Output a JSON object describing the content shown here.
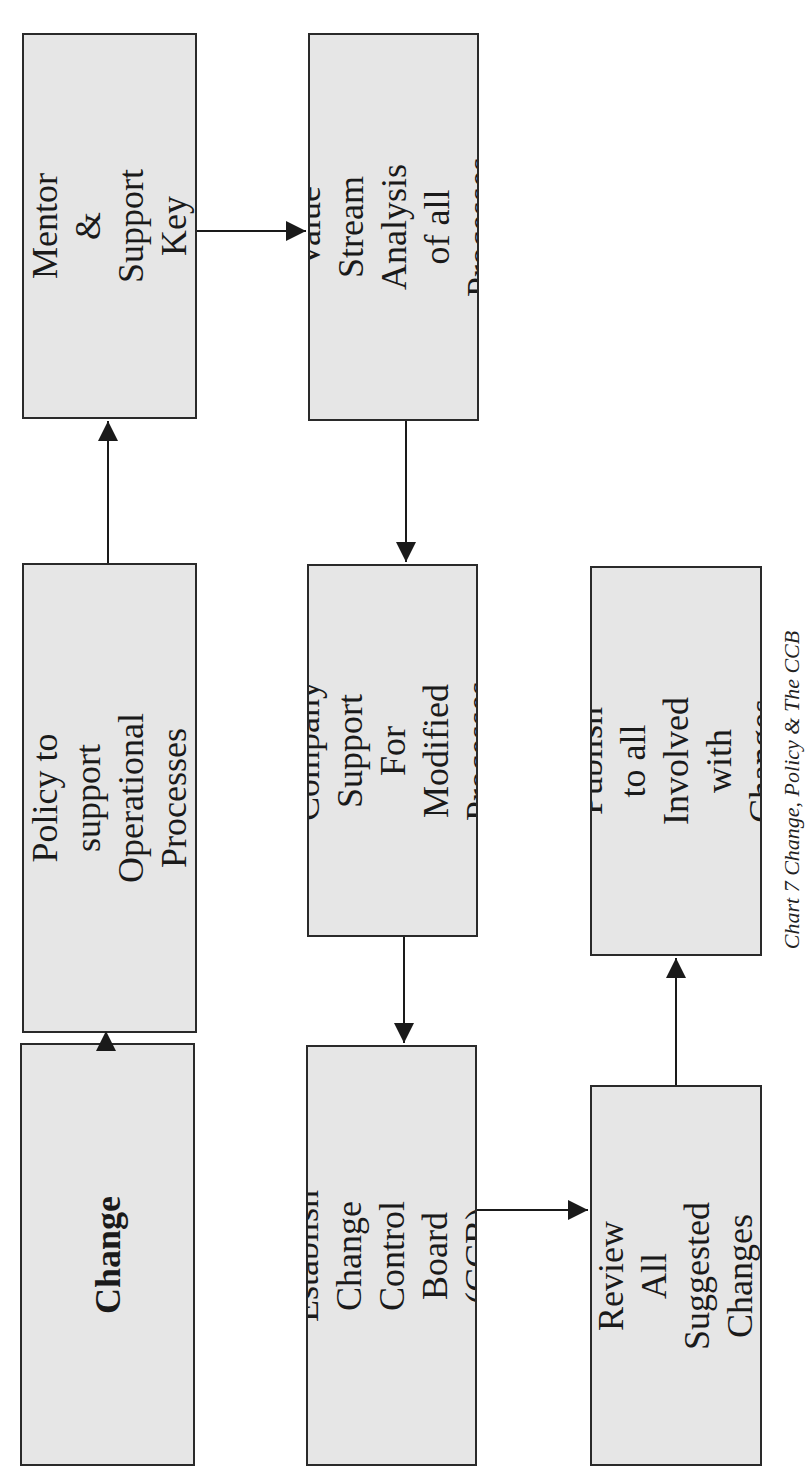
{
  "diagram": {
    "caption": "Chart 7  Change, Policy & The CCB",
    "orientation": "rotated 90° counterclockwise",
    "nodes": [
      {
        "id": "change",
        "label": "Change",
        "bold": true
      },
      {
        "id": "policy",
        "label": "Policy to support\nOperational\nProcesses"
      },
      {
        "id": "teach",
        "label": "Teach, Mentor &\nSupport Key\nProcesses"
      },
      {
        "id": "value_stream",
        "label": "Value Stream\nAnalysis of all\nProcesses"
      },
      {
        "id": "company_support",
        "label": "Company Support\nFor Modified\nProcesses"
      },
      {
        "id": "ccb",
        "label": "Establish Change\nControl Board\n(CCB)"
      },
      {
        "id": "review",
        "label": "Review All\nSuggested\nChanges"
      },
      {
        "id": "publish",
        "label": "Publish to all\nInvolved with\nChanges"
      }
    ],
    "edges": [
      {
        "from": "change",
        "to": "policy"
      },
      {
        "from": "policy",
        "to": "teach"
      },
      {
        "from": "teach",
        "to": "value_stream"
      },
      {
        "from": "value_stream",
        "to": "company_support"
      },
      {
        "from": "company_support",
        "to": "ccb"
      },
      {
        "from": "ccb",
        "to": "review"
      },
      {
        "from": "review",
        "to": "publish"
      }
    ],
    "colors": {
      "box_fill": "#e6e6e6",
      "box_border": "#2a2a2a",
      "arrow": "#1a1a1a"
    }
  }
}
